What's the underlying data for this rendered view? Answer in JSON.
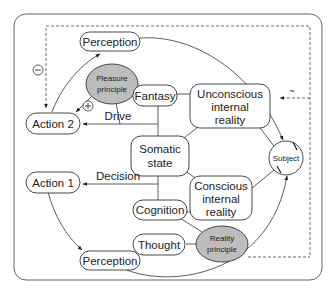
{
  "diagram": {
    "nodes": {
      "perception_top": "Perception",
      "pleasure_principle_line1": "Pleasure",
      "pleasure_principle_line2": "principle",
      "fantasy": "Fantasy",
      "unconscious_line1": "Unconscious",
      "unconscious_line2": "internal",
      "unconscious_line3": "reality",
      "action2": "Action 2",
      "somatic_line1": "Somatic",
      "somatic_line2": "state",
      "subject": "Subject",
      "action1": "Action 1",
      "conscious_line1": "Conscious",
      "conscious_line2": "internal",
      "conscious_line3": "reality",
      "cognition": "Cognition",
      "thought": "Thought",
      "reality_principle_line1": "Reality",
      "reality_principle_line2": "principle",
      "perception_bottom": "Perception"
    },
    "edge_labels": {
      "drive": "Drive",
      "decision": "Decision",
      "minus": "−",
      "plus": "+",
      "tilde": "~"
    },
    "colors": {
      "principle_fill": "#bdbdbd",
      "stroke": "#333333",
      "frame": "#666666"
    }
  }
}
